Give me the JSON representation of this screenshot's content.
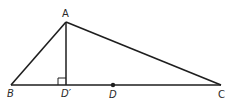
{
  "diagram": {
    "type": "triangle-with-altitude",
    "stroke_color": "#1e1e1e",
    "points": {
      "A": {
        "x": 66,
        "y": 22,
        "label": "A"
      },
      "B": {
        "x": 11,
        "y": 85,
        "label": "B"
      },
      "C": {
        "x": 221,
        "y": 85,
        "label": "C"
      },
      "D_prime": {
        "x": 66,
        "y": 85,
        "label": "D′"
      },
      "D": {
        "x": 113,
        "y": 85,
        "label": "D"
      }
    },
    "segments": [
      "AB",
      "AC",
      "BC",
      "AD′"
    ],
    "right_angle_at": "D′"
  }
}
